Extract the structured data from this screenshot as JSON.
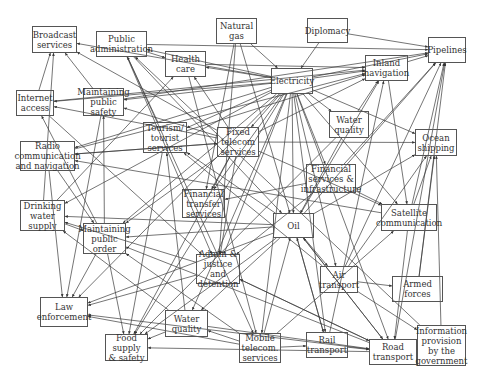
{
  "diagram": {
    "nodes": [
      {
        "id": "broadcast",
        "label": "Broadcast\nservices",
        "x": 32,
        "y": 26,
        "w": 45,
        "h": 27
      },
      {
        "id": "public_admin",
        "label": "Public\nadministration",
        "x": 96,
        "y": 31,
        "w": 51,
        "h": 26
      },
      {
        "id": "natural_gas",
        "label": "Natural\ngas",
        "x": 216,
        "y": 18,
        "w": 41,
        "h": 26
      },
      {
        "id": "diplomacy",
        "label": "Diplomacy",
        "x": 307,
        "y": 18,
        "w": 41,
        "h": 25
      },
      {
        "id": "pipelines",
        "label": "Pipelines",
        "x": 428,
        "y": 37,
        "w": 38,
        "h": 26
      },
      {
        "id": "health_care",
        "label": "Health\ncare",
        "x": 165,
        "y": 51,
        "w": 41,
        "h": 26
      },
      {
        "id": "electricity",
        "label": "Electricity",
        "x": 271,
        "y": 68,
        "w": 42,
        "h": 26
      },
      {
        "id": "inland_nav",
        "label": "Inland\nnavigation",
        "x": 365,
        "y": 55,
        "w": 43,
        "h": 26
      },
      {
        "id": "internet",
        "label": "Internet\naccess",
        "x": 16,
        "y": 90,
        "w": 38,
        "h": 26
      },
      {
        "id": "public_safety",
        "label": "Maintaining\npublic\nsafety",
        "x": 83,
        "y": 88,
        "w": 41,
        "h": 28
      },
      {
        "id": "tourism",
        "label": "Tourism/\ntourist\nservices",
        "x": 143,
        "y": 122,
        "w": 44,
        "h": 31
      },
      {
        "id": "fixed_telecom",
        "label": "Fixed\ntelecom\nservices",
        "x": 217,
        "y": 127,
        "w": 42,
        "h": 30
      },
      {
        "id": "water_quality_top",
        "label": "Water\nquality",
        "x": 329,
        "y": 111,
        "w": 40,
        "h": 27
      },
      {
        "id": "ocean_shipping",
        "label": "Ocean\nshipping",
        "x": 415,
        "y": 129,
        "w": 42,
        "h": 27
      },
      {
        "id": "radio",
        "label": "Radio\ncommunication\nand navigation",
        "x": 20,
        "y": 141,
        "w": 55,
        "h": 30
      },
      {
        "id": "financial_infra",
        "label": "Financial\nservices &\ninfrastructure",
        "x": 306,
        "y": 164,
        "w": 50,
        "h": 29
      },
      {
        "id": "financial_transfer",
        "label": "Financial\ntransfer\nservices",
        "x": 182,
        "y": 189,
        "w": 43,
        "h": 29
      },
      {
        "id": "drinking_water",
        "label": "Drinking\nwater\nsupply",
        "x": 20,
        "y": 200,
        "w": 45,
        "h": 31
      },
      {
        "id": "satellite",
        "label": "Satellite\ncommunication",
        "x": 381,
        "y": 204,
        "w": 56,
        "h": 27
      },
      {
        "id": "public_order",
        "label": "Maintaining\npublic\norder",
        "x": 83,
        "y": 223,
        "w": 43,
        "h": 31
      },
      {
        "id": "oil",
        "label": "Oil",
        "x": 273,
        "y": 213,
        "w": 41,
        "h": 25
      },
      {
        "id": "admin_justice",
        "label": "Admin &\njustice and\ndetention",
        "x": 196,
        "y": 254,
        "w": 44,
        "h": 30
      },
      {
        "id": "air_transport",
        "label": "Air\ntransport",
        "x": 320,
        "y": 266,
        "w": 38,
        "h": 27
      },
      {
        "id": "armed_forces",
        "label": "Armed forces",
        "x": 392,
        "y": 276,
        "w": 51,
        "h": 26
      },
      {
        "id": "law_enforcement",
        "label": "Law\nenforcement",
        "x": 40,
        "y": 297,
        "w": 48,
        "h": 30
      },
      {
        "id": "water_quality_bottom",
        "label": "Water\nquality",
        "x": 165,
        "y": 310,
        "w": 43,
        "h": 27
      },
      {
        "id": "food_supply",
        "label": "Food supply\n& safety",
        "x": 105,
        "y": 334,
        "w": 43,
        "h": 27
      },
      {
        "id": "mobile_telecom",
        "label": "Mobile\ntelecom.\nservices",
        "x": 239,
        "y": 333,
        "w": 42,
        "h": 30
      },
      {
        "id": "rail_transport",
        "label": "Rail\ntransport",
        "x": 306,
        "y": 332,
        "w": 42,
        "h": 26
      },
      {
        "id": "road_transport",
        "label": "Road\ntransport",
        "x": 369,
        "y": 339,
        "w": 48,
        "h": 26
      },
      {
        "id": "info_gov",
        "label": "Information\nprovision\nby the\ngovernment",
        "x": 417,
        "y": 325,
        "w": 49,
        "h": 41
      }
    ],
    "edges": [
      [
        "electricity",
        "broadcast"
      ],
      [
        "electricity",
        "public_admin"
      ],
      [
        "electricity",
        "health_care"
      ],
      [
        "electricity",
        "internet"
      ],
      [
        "electricity",
        "public_safety"
      ],
      [
        "electricity",
        "tourism"
      ],
      [
        "electricity",
        "fixed_telecom"
      ],
      [
        "electricity",
        "water_quality_top"
      ],
      [
        "electricity",
        "radio"
      ],
      [
        "electricity",
        "financial_infra"
      ],
      [
        "electricity",
        "financial_transfer"
      ],
      [
        "electricity",
        "drinking_water"
      ],
      [
        "electricity",
        "public_order"
      ],
      [
        "electricity",
        "oil"
      ],
      [
        "electricity",
        "admin_justice"
      ],
      [
        "electricity",
        "air_transport"
      ],
      [
        "electricity",
        "law_enforcement"
      ],
      [
        "electricity",
        "water_quality_bottom"
      ],
      [
        "electricity",
        "food_supply"
      ],
      [
        "electricity",
        "mobile_telecom"
      ],
      [
        "electricity",
        "rail_transport"
      ],
      [
        "electricity",
        "road_transport"
      ],
      [
        "electricity",
        "inland_nav"
      ],
      [
        "electricity",
        "pipelines"
      ],
      [
        "electricity",
        "ocean_shipping"
      ],
      [
        "electricity",
        "satellite"
      ],
      [
        "natural_gas",
        "electricity"
      ],
      [
        "natural_gas",
        "oil"
      ],
      [
        "natural_gas",
        "financial_transfer"
      ],
      [
        "natural_gas",
        "admin_justice"
      ],
      [
        "diplomacy",
        "pipelines"
      ],
      [
        "diplomacy",
        "electricity"
      ],
      [
        "public_admin",
        "pipelines"
      ],
      [
        "public_admin",
        "health_care"
      ],
      [
        "public_admin",
        "oil"
      ],
      [
        "public_admin",
        "admin_justice"
      ],
      [
        "public_admin",
        "mobile_telecom"
      ],
      [
        "fixed_telecom",
        "broadcast"
      ],
      [
        "fixed_telecom",
        "internet"
      ],
      [
        "fixed_telecom",
        "radio"
      ],
      [
        "fixed_telecom",
        "public_safety"
      ],
      [
        "fixed_telecom",
        "financial_transfer"
      ],
      [
        "fixed_telecom",
        "public_order"
      ],
      [
        "fixed_telecom",
        "admin_justice"
      ],
      [
        "fixed_telecom",
        "food_supply"
      ],
      [
        "fixed_telecom",
        "satellite"
      ],
      [
        "fixed_telecom",
        "ocean_shipping"
      ],
      [
        "fixed_telecom",
        "inland_nav"
      ],
      [
        "fixed_telecom",
        "health_care"
      ],
      [
        "oil",
        "pipelines"
      ],
      [
        "oil",
        "inland_nav"
      ],
      [
        "oil",
        "ocean_shipping"
      ],
      [
        "oil",
        "air_transport"
      ],
      [
        "oil",
        "rail_transport"
      ],
      [
        "oil",
        "road_transport"
      ],
      [
        "oil",
        "water_quality_bottom"
      ],
      [
        "oil",
        "food_supply"
      ],
      [
        "oil",
        "drinking_water"
      ],
      [
        "oil",
        "law_enforcement"
      ],
      [
        "oil",
        "public_order"
      ],
      [
        "oil",
        "tourism"
      ],
      [
        "road_transport",
        "food_supply"
      ],
      [
        "road_transport",
        "law_enforcement"
      ],
      [
        "road_transport",
        "public_order"
      ],
      [
        "road_transport",
        "admin_justice"
      ],
      [
        "road_transport",
        "pipelines"
      ],
      [
        "road_transport",
        "oil"
      ],
      [
        "air_transport",
        "pipelines"
      ],
      [
        "air_transport",
        "ocean_shipping"
      ],
      [
        "air_transport",
        "armed_forces"
      ],
      [
        "air_transport",
        "info_gov"
      ],
      [
        "air_transport",
        "tourism"
      ],
      [
        "rail_transport",
        "road_transport"
      ],
      [
        "rail_transport",
        "oil"
      ],
      [
        "rail_transport",
        "inland_nav"
      ],
      [
        "mobile_telecom",
        "rail_transport"
      ],
      [
        "mobile_telecom",
        "water_quality_bottom"
      ],
      [
        "mobile_telecom",
        "public_order"
      ],
      [
        "mobile_telecom",
        "law_enforcement"
      ],
      [
        "mobile_telecom",
        "oil"
      ],
      [
        "mobile_telecom",
        "satellite"
      ],
      [
        "water_quality_bottom",
        "food_supply"
      ],
      [
        "water_quality_bottom",
        "drinking_water"
      ],
      [
        "water_quality_bottom",
        "tourism"
      ],
      [
        "water_quality_bottom",
        "road_transport"
      ],
      [
        "satellite",
        "ocean_shipping"
      ],
      [
        "satellite",
        "pipelines"
      ],
      [
        "satellite",
        "radio"
      ],
      [
        "satellite",
        "road_transport"
      ],
      [
        "financial_infra",
        "financial_transfer"
      ],
      [
        "financial_infra",
        "satellite"
      ],
      [
        "financial_infra",
        "pipelines"
      ],
      [
        "financial_infra",
        "admin_justice"
      ],
      [
        "drinking_water",
        "broadcast"
      ],
      [
        "drinking_water",
        "public_order"
      ],
      [
        "drinking_water",
        "health_care"
      ],
      [
        "public_order",
        "law_enforcement"
      ],
      [
        "public_order",
        "food_supply"
      ],
      [
        "public_order",
        "internet"
      ],
      [
        "public_order",
        "public_safety"
      ],
      [
        "radio",
        "fixed_telecom"
      ],
      [
        "radio",
        "public_order"
      ],
      [
        "radio",
        "law_enforcement"
      ],
      [
        "radio",
        "inland_nav"
      ],
      [
        "internet",
        "broadcast"
      ],
      [
        "internet",
        "inland_nav"
      ],
      [
        "internet",
        "admin_justice"
      ],
      [
        "public_safety",
        "broadcast"
      ],
      [
        "public_safety",
        "pipelines"
      ],
      [
        "public_safety",
        "law_enforcement"
      ],
      [
        "tourism",
        "public_admin"
      ],
      [
        "tourism",
        "inland_nav"
      ],
      [
        "tourism",
        "food_supply"
      ],
      [
        "health_care",
        "mobile_telecom"
      ],
      [
        "health_care",
        "inland_nav"
      ],
      [
        "water_quality_top",
        "inland_nav"
      ],
      [
        "water_quality_top",
        "oil"
      ],
      [
        "water_quality_top",
        "food_supply"
      ],
      [
        "inland_nav",
        "satellite"
      ],
      [
        "inland_nav",
        "pipelines"
      ],
      [
        "admin_justice",
        "law_enforcement"
      ],
      [
        "admin_justice",
        "drinking_water"
      ],
      [
        "admin_justice",
        "road_transport"
      ],
      [
        "armed_forces",
        "pipelines"
      ],
      [
        "armed_forces",
        "ocean_shipping"
      ],
      [
        "info_gov",
        "public_admin"
      ],
      [
        "info_gov",
        "ocean_shipping"
      ]
    ]
  }
}
